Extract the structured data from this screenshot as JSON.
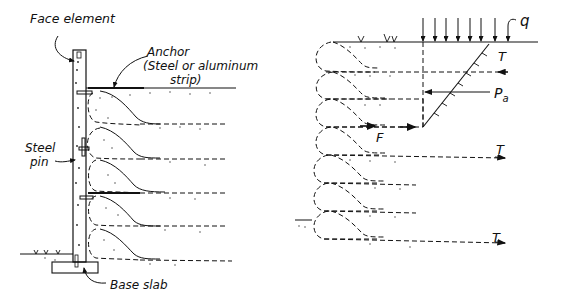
{
  "figure": {
    "left_panel": {
      "labels": {
        "face_element": "Face element",
        "anchor_line1": "Anchor",
        "anchor_line2": "(Steel or aluminum",
        "anchor_line3": "strip)",
        "steel_line1": "Steel",
        "steel_line2": "pin",
        "base_slab": "Base slab"
      },
      "components": [
        "face-element",
        "anchor-strips",
        "steel-pins",
        "base-slab",
        "soil-layers"
      ],
      "layer_count": 5
    },
    "right_panel": {
      "labels": {
        "surcharge": "q",
        "tension_top": "T",
        "active_pressure": "P",
        "active_pressure_sub": "a",
        "friction": "F",
        "tension_mid": "T",
        "tension_bottom": "T"
      },
      "surcharge_arrow_count": 8,
      "layer_count": 7
    },
    "colors": {
      "ink": "#111111",
      "background": "#ffffff"
    }
  }
}
